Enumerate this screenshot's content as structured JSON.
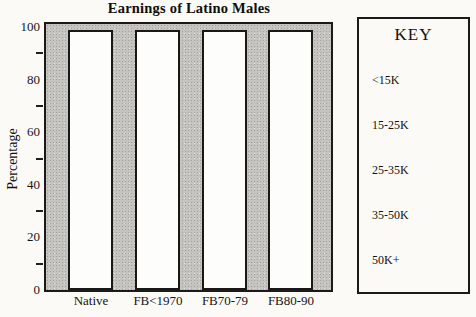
{
  "title": "Earnings of Latino Males",
  "y_axis": {
    "label": "Percentage",
    "major_ticks": [
      100,
      80,
      60,
      40,
      20,
      0
    ],
    "minor_ticks": [
      90,
      70,
      50,
      30,
      10
    ]
  },
  "x_axis": {
    "categories": [
      "Native",
      "FB<1970",
      "FB70-79",
      "FB80-90"
    ]
  },
  "key": {
    "title": "KEY",
    "entries": [
      "<15K",
      "15-25K",
      "25-35K",
      "35-50K",
      "50K+"
    ]
  },
  "chart_data": {
    "type": "bar",
    "title": "Earnings of Latino Males",
    "xlabel": "",
    "ylabel": "Percentage",
    "categories": [
      "Native",
      "FB<1970",
      "FB70-79",
      "FB80-90"
    ],
    "values": [
      100,
      100,
      100,
      100
    ],
    "ylim": [
      0,
      100
    ],
    "grid": false,
    "legend_position": "right",
    "legend_title": "KEY",
    "legend_entries": [
      "<15K",
      "15-25K",
      "25-35K",
      "35-50K",
      "50K+"
    ],
    "bar_color": "#fdfdfb",
    "bar_border_color": "#191816",
    "plot_background_color": "#c5c4c1",
    "frame_color": "#1b1a18",
    "page_background_color": "#fbfaf6"
  }
}
